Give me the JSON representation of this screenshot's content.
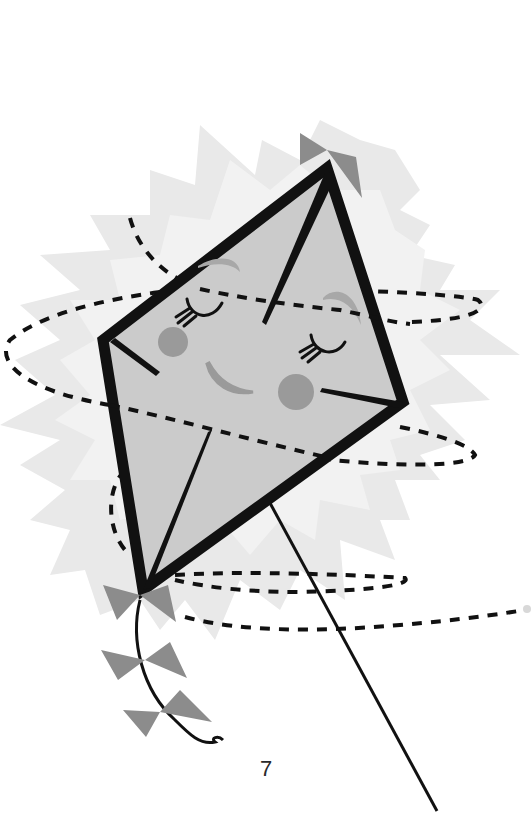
{
  "page": {
    "number": "7"
  },
  "illustration": {
    "subject": "smiling kite with closed eyes",
    "elements": [
      "starburst-background",
      "kite-body",
      "kite-face",
      "kite-bows",
      "kite-tail",
      "kite-string",
      "dashed-swirl"
    ],
    "colors": {
      "background": "#ffffff",
      "starburst": "#e6e6e6",
      "kite_fill": "#c9c9c9",
      "kite_frame": "#111111",
      "bow": "#8c8c8c",
      "cheeks": "#9a9a9a",
      "brows": "#a8a8a8",
      "dashes": "#111111"
    }
  }
}
